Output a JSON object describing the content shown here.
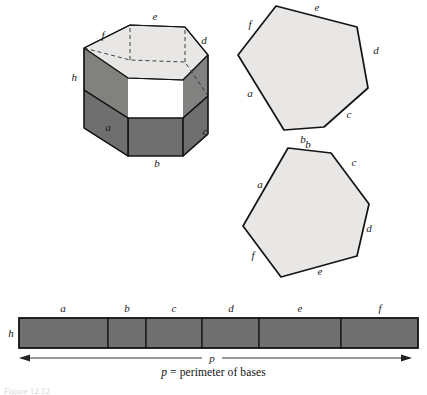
{
  "figure": {
    "caption_var": "p",
    "caption_text": "= perimeter of bases",
    "figure_tag": "Figure 12.12",
    "colors": {
      "face_light": "#e8e7e5",
      "face_dark": "#6f6f6f",
      "outline": "#141414",
      "hidden_edge": "#3a3a3a",
      "background": "#ffffff"
    }
  },
  "prism": {
    "name": "hexagonal-prism",
    "labels": {
      "top_edge": "e",
      "upper_left_edge": "f",
      "upper_right_edge": "d",
      "height": "h",
      "front_left_face": "a",
      "front_bottom_face": "b",
      "front_right_face": "c"
    }
  },
  "hexagon_top": {
    "name": "top-base-hexagon",
    "side_labels": [
      "f",
      "e",
      "d",
      "c",
      "b",
      "a"
    ]
  },
  "hexagon_bottom": {
    "name": "bottom-base-hexagon",
    "side_labels": [
      "b",
      "c",
      "d",
      "e",
      "f",
      "a"
    ]
  },
  "lateral_strip": {
    "name": "unrolled-lateral-surface",
    "height_label": "h",
    "perimeter_label": "p",
    "segments": [
      {
        "label": "a"
      },
      {
        "label": "b"
      },
      {
        "label": "c"
      },
      {
        "label": "d"
      },
      {
        "label": "e"
      },
      {
        "label": "f"
      }
    ]
  }
}
